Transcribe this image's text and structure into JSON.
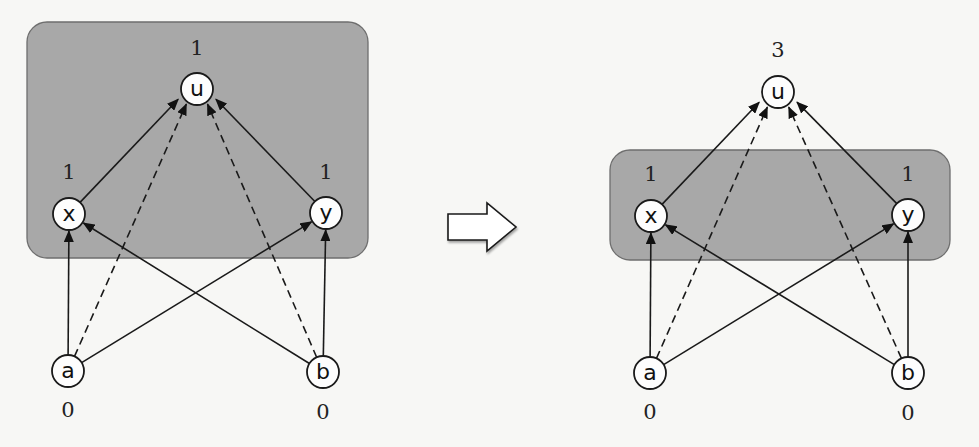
{
  "panels": [
    {
      "id": "before",
      "highlighted_group": [
        "u",
        "x",
        "y"
      ],
      "nodes": [
        {
          "id": "u",
          "label": "u",
          "value": "1"
        },
        {
          "id": "x",
          "label": "x",
          "value": "1"
        },
        {
          "id": "y",
          "label": "y",
          "value": "1"
        },
        {
          "id": "a",
          "label": "a",
          "value": "0"
        },
        {
          "id": "b",
          "label": "b",
          "value": "0"
        }
      ]
    },
    {
      "id": "after",
      "highlighted_group": [
        "x",
        "y"
      ],
      "nodes": [
        {
          "id": "u",
          "label": "u",
          "value": "3"
        },
        {
          "id": "x",
          "label": "x",
          "value": "1"
        },
        {
          "id": "y",
          "label": "y",
          "value": "1"
        },
        {
          "id": "a",
          "label": "a",
          "value": "0"
        },
        {
          "id": "b",
          "label": "b",
          "value": "0"
        }
      ]
    }
  ],
  "edges": [
    {
      "from": "x",
      "to": "u",
      "style": "solid"
    },
    {
      "from": "y",
      "to": "u",
      "style": "solid"
    },
    {
      "from": "a",
      "to": "u",
      "style": "dashed"
    },
    {
      "from": "b",
      "to": "u",
      "style": "dashed"
    },
    {
      "from": "a",
      "to": "x",
      "style": "solid"
    },
    {
      "from": "a",
      "to": "y",
      "style": "solid"
    },
    {
      "from": "b",
      "to": "x",
      "style": "solid"
    },
    {
      "from": "b",
      "to": "y",
      "style": "solid"
    }
  ],
  "transition": {
    "icon": "right-arrow-icon",
    "direction": "left-to-right"
  }
}
